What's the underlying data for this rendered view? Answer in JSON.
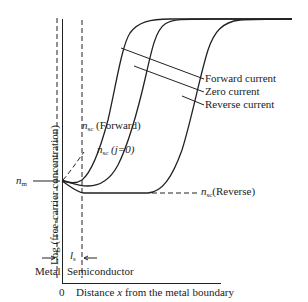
{
  "diagram": {
    "y_axis_label": "Log (free-carrier concentration)",
    "x_axis_label_prefix": "Distance ",
    "x_axis_label_var": "x",
    "x_axis_label_suffix": " from the metal boundary",
    "origin_label": "0",
    "metal_label": "Metal",
    "semiconductor_label": "Semiconductor",
    "ls_label": "l",
    "ls_sub": "s",
    "nm_label": "n",
    "nm_sub": "m",
    "nsc_forward": {
      "var": "n",
      "sub": "sc",
      "text": " (Forward)"
    },
    "nsc_zero": {
      "var": "n",
      "sub": "sc",
      "text": " (j=0)"
    },
    "nsc_reverse": {
      "var": "n",
      "sub": "sc",
      "text": "(Reverse)"
    },
    "legend": [
      {
        "label": "Forward current"
      },
      {
        "label": "Zero current"
      },
      {
        "label": "Reverse current"
      }
    ],
    "colors": {
      "line": "#222222",
      "background": "#ffffff"
    }
  }
}
